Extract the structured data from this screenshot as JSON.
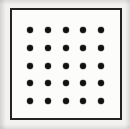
{
  "figure": {
    "frame": {
      "name": "rectangular-border",
      "x": 10,
      "y": 8,
      "width": 112,
      "height": 112,
      "stroke_color": "#242424",
      "stroke_width": 2,
      "fill_color": "#fcfcfb"
    },
    "background_color": "#f3f2f0",
    "dot_color": "#111111",
    "dot_diameter": 6,
    "grid": {
      "rows": 5,
      "columns": 5,
      "total_dots": 25,
      "spacing_x": 17.8,
      "spacing_y": 17.8,
      "first_dot_x": 30,
      "first_dot_y": 30,
      "last_dot_x": 101,
      "last_dot_y": 101
    },
    "dots": [
      {
        "row": 1,
        "col": 1,
        "cx": 30,
        "cy": 30
      },
      {
        "row": 1,
        "col": 2,
        "cx": 48,
        "cy": 30
      },
      {
        "row": 1,
        "col": 3,
        "cx": 66,
        "cy": 30
      },
      {
        "row": 1,
        "col": 4,
        "cx": 83,
        "cy": 30
      },
      {
        "row": 1,
        "col": 5,
        "cx": 101,
        "cy": 30
      },
      {
        "row": 2,
        "col": 1,
        "cx": 30,
        "cy": 48
      },
      {
        "row": 2,
        "col": 2,
        "cx": 48,
        "cy": 48
      },
      {
        "row": 2,
        "col": 3,
        "cx": 66,
        "cy": 48
      },
      {
        "row": 2,
        "col": 4,
        "cx": 83,
        "cy": 48
      },
      {
        "row": 2,
        "col": 5,
        "cx": 101,
        "cy": 48
      },
      {
        "row": 3,
        "col": 1,
        "cx": 30,
        "cy": 66
      },
      {
        "row": 3,
        "col": 2,
        "cx": 48,
        "cy": 66
      },
      {
        "row": 3,
        "col": 3,
        "cx": 66,
        "cy": 66
      },
      {
        "row": 3,
        "col": 4,
        "cx": 83,
        "cy": 66
      },
      {
        "row": 3,
        "col": 5,
        "cx": 101,
        "cy": 66
      },
      {
        "row": 4,
        "col": 1,
        "cx": 30,
        "cy": 83
      },
      {
        "row": 4,
        "col": 2,
        "cx": 48,
        "cy": 83
      },
      {
        "row": 4,
        "col": 3,
        "cx": 66,
        "cy": 83
      },
      {
        "row": 4,
        "col": 4,
        "cx": 83,
        "cy": 83
      },
      {
        "row": 4,
        "col": 5,
        "cx": 101,
        "cy": 83
      },
      {
        "row": 5,
        "col": 1,
        "cx": 30,
        "cy": 101
      },
      {
        "row": 5,
        "col": 2,
        "cx": 48,
        "cy": 101
      },
      {
        "row": 5,
        "col": 3,
        "cx": 66,
        "cy": 101
      },
      {
        "row": 5,
        "col": 4,
        "cx": 83,
        "cy": 101
      },
      {
        "row": 5,
        "col": 5,
        "cx": 101,
        "cy": 101
      }
    ]
  }
}
